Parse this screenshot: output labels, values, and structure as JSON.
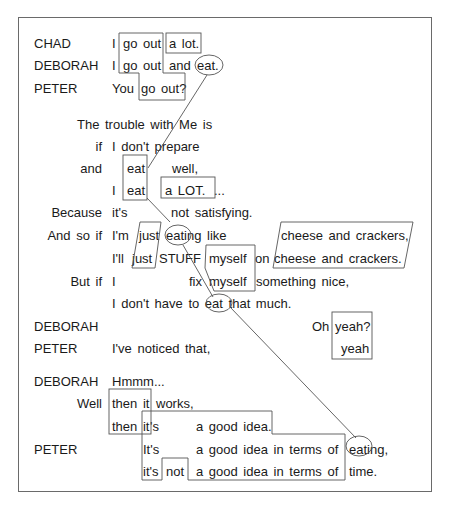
{
  "figure": {
    "type": "conversation transcript with intonation-unit alignment",
    "lines": [
      {
        "speaker": "CHAD",
        "text": "I go out a lot."
      },
      {
        "speaker": "DEBORAH",
        "text": "I go out and eat."
      },
      {
        "speaker": "PETER",
        "text": "You go out?"
      },
      {
        "speaker": "",
        "text": "The trouble with Me is"
      },
      {
        "speaker": "",
        "lead": "if",
        "text": "I don't prepare"
      },
      {
        "speaker": "",
        "lead": "and",
        "text": "eat well,"
      },
      {
        "speaker": "",
        "text": "I eat a LOT. ..."
      },
      {
        "speaker": "",
        "lead": "Because",
        "text": "it's not satisfying."
      },
      {
        "speaker": "",
        "lead": "And so if",
        "text": "I'm just eating like cheese and crackers,"
      },
      {
        "speaker": "",
        "text": "I'll just STUFF myself on cheese and crackers."
      },
      {
        "speaker": "",
        "lead": "But if",
        "text": "I fix myself something nice,"
      },
      {
        "speaker": "",
        "text": "I don't have to eat that much."
      },
      {
        "speaker": "DEBORAH",
        "text": "Oh yeah?"
      },
      {
        "speaker": "PETER",
        "text": "I've noticed that, yeah"
      },
      {
        "speaker": "DEBORAH",
        "text": "Hmmm..."
      },
      {
        "speaker": "",
        "lead": "Well",
        "text": "then it works,"
      },
      {
        "speaker": "",
        "text": "then it's a good idea."
      },
      {
        "speaker": "PETER",
        "text": "It's a good idea in terms of eating,"
      },
      {
        "speaker": "",
        "text": "it's not a good idea in terms of time."
      }
    ]
  },
  "labels": {
    "chad": "CHAD",
    "deborah": "DEBORAH",
    "peter": "PETER",
    "l1": [
      "I",
      "go out",
      "a lot."
    ],
    "l2": [
      "I",
      "go out",
      "and",
      "eat."
    ],
    "l3": [
      "You",
      "go out?"
    ],
    "l4": "The trouble with Me is",
    "l5": [
      "if",
      "I don't prepare"
    ],
    "l6": [
      "and",
      "eat",
      "well,"
    ],
    "l7": [
      "I",
      "eat",
      "a LOT.",
      "..."
    ],
    "l8": [
      "Because",
      "it's",
      "not satisfying."
    ],
    "l9": [
      "And so if",
      "I'm",
      "just",
      "eating like",
      "cheese and crackers,"
    ],
    "l10": [
      "I'll",
      "just",
      "STUFF",
      "myself",
      "on",
      "cheese and crackers."
    ],
    "l11": [
      "But if",
      "I",
      "fix",
      "myself",
      "something nice,"
    ],
    "l12": "I don't have to eat that much.",
    "l13": [
      "Oh",
      "yeah?"
    ],
    "l14": [
      "I've noticed that,",
      "yeah"
    ],
    "l15": "Hmmm...",
    "l16": [
      "Well",
      "then it",
      "works,"
    ],
    "l17": [
      "then it",
      "'s",
      "a good idea."
    ],
    "l18": [
      "It's",
      "a good idea in terms of",
      "eating,"
    ],
    "l19": [
      "it's",
      "not",
      "a good idea in terms of",
      "time."
    ]
  }
}
